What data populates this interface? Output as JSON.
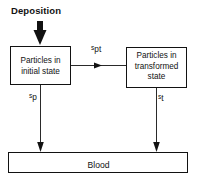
{
  "diagram": {
    "title_label": "Deposition",
    "type": "flow-diagram",
    "background_color": "#ffffff",
    "line_color": "#121212",
    "boxes": [
      {
        "id": "initial-state",
        "label": "Particles in initial state",
        "line1": "Particles in",
        "line2": "initial state",
        "x": 10,
        "y": 46,
        "width": 61,
        "height": 39
      },
      {
        "id": "transformed-state",
        "label": "Particles in transformed state",
        "line1": "Particles in",
        "line2": "transformed",
        "line3": "state",
        "x": 126,
        "y": 47,
        "width": 61,
        "height": 41
      },
      {
        "id": "blood",
        "label": "Blood",
        "x": 8,
        "y": 152,
        "width": 180,
        "height": 21
      }
    ],
    "arrows": [
      {
        "id": "deposition-input",
        "style": "thick-solid",
        "from": "external",
        "to": "initial-state",
        "label": "Deposition"
      },
      {
        "id": "initial-to-transformed",
        "style": "thin",
        "from": "initial-state",
        "to": "transformed-state",
        "rate_base": "s",
        "rate_sub": "pt",
        "rate_label": "s pt"
      },
      {
        "id": "initial-to-blood",
        "style": "thin",
        "from": "initial-state",
        "to": "blood",
        "rate_base": "s",
        "rate_sub": "p",
        "rate_label": "s p"
      },
      {
        "id": "transformed-to-blood",
        "style": "thin",
        "from": "transformed-state",
        "to": "blood",
        "rate_base": "s",
        "rate_sub": "t",
        "rate_label": "s t"
      }
    ]
  }
}
